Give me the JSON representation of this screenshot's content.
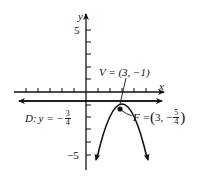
{
  "diagram": {
    "type": "parabola-graph",
    "axes": {
      "x_label": "x",
      "y_label": "y",
      "y_tick_labels": [
        {
          "value": 5,
          "text": "5"
        },
        {
          "value": -5,
          "text": "−5"
        }
      ],
      "x_ticks": [
        -6,
        -5,
        -4,
        -3,
        -2,
        -1,
        1,
        2,
        3,
        4,
        5
      ],
      "y_ticks": [
        -5,
        -4,
        -3,
        -2,
        -1,
        1,
        2,
        3,
        4,
        5
      ]
    },
    "vertex": {
      "label": "V = (3, −1)",
      "x": 3,
      "y": -1
    },
    "focus": {
      "label_prefix": "F = ",
      "x_text": "3, −",
      "frac_num": "5",
      "frac_den": "4",
      "x": 3,
      "y": -1.25
    },
    "directrix": {
      "label_prefix": "D: ",
      "eq_text": "y = −",
      "frac_num": "3",
      "frac_den": "4",
      "y": -0.75
    },
    "curve": {
      "equation": "(x-3)^2 = -y-1",
      "opens": "down"
    },
    "colors": {
      "ink": "#111111",
      "background": "#ffffff"
    }
  }
}
